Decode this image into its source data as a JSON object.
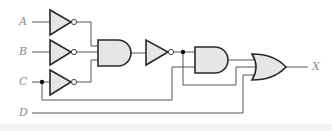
{
  "diagram": {
    "type": "logic-circuit",
    "inputs": [
      {
        "label": "A",
        "x": 22,
        "y": 22
      },
      {
        "label": "B",
        "x": 22,
        "y": 52
      },
      {
        "label": "C",
        "x": 22,
        "y": 82
      },
      {
        "label": "D",
        "x": 22,
        "y": 113
      }
    ],
    "output": {
      "label": "X",
      "x": 314,
      "y": 67
    },
    "gates": [
      {
        "id": "inv-a",
        "type": "NOT",
        "input": "A"
      },
      {
        "id": "inv-b",
        "type": "NOT",
        "input": "B"
      },
      {
        "id": "inv-c",
        "type": "NOT",
        "input": "C"
      },
      {
        "id": "and-1",
        "type": "AND",
        "inputs": [
          "inv-a",
          "inv-b",
          "inv-c"
        ]
      },
      {
        "id": "inv-4",
        "type": "NOT",
        "input": "and-1"
      },
      {
        "id": "and-2",
        "type": "AND",
        "inputs": [
          "inv-4",
          "C"
        ]
      },
      {
        "id": "or-1",
        "type": "OR",
        "inputs": [
          "and-2",
          "inv-4",
          "D"
        ],
        "output": "X"
      }
    ],
    "colors": {
      "gate_fill": "#e6e6e6",
      "gate_stroke": "#2a2a2a",
      "wire": "#555555",
      "label": "#8a8a8a"
    }
  }
}
